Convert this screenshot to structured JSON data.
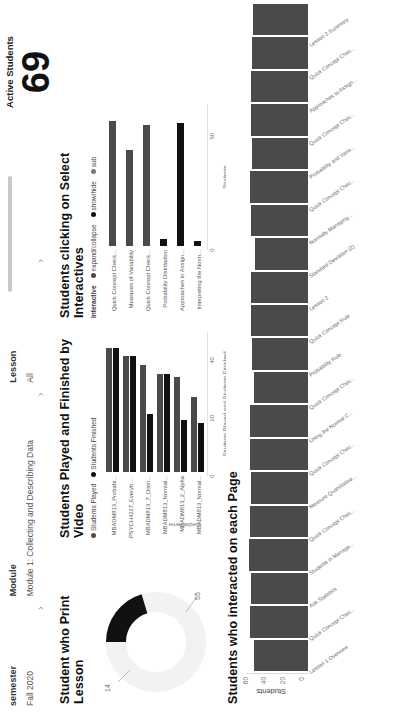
{
  "filters": {
    "items": [
      {
        "label": "semester",
        "value": "Fall 2020",
        "chevron": "chevron-right"
      },
      {
        "label": "Module",
        "value": "Module 1: Collecting and Describing Data",
        "chevron": "chevron-right"
      },
      {
        "label": "Lesson",
        "value": "All",
        "chevron": "chevron-right"
      }
    ]
  },
  "kpi": {
    "label": "Active Students",
    "value": "69"
  },
  "print_card": {
    "title": "Student who Print Lesson",
    "chart_data": {
      "type": "pie",
      "title": "Student who Print Lesson",
      "labels": [
        "Printed",
        "Not printed"
      ],
      "values": [
        14,
        55
      ],
      "value_labels": [
        "14",
        "55"
      ],
      "colors": [
        "#111111",
        "#f2f2f2"
      ],
      "legend": "none"
    }
  },
  "video_card": {
    "title": "Students Played and Finished by Video",
    "legend": [
      {
        "label": "Students Played",
        "color": "#4a4a4a"
      },
      {
        "label": "Students Finished",
        "color": "#111111"
      }
    ],
    "chart_data": {
      "type": "bar",
      "orientation": "horizontal",
      "title": "Students Played and Finished by Video",
      "xlabel": "Students Played and Students Finished",
      "ylabel": "mediaName",
      "xlim": [
        0,
        45
      ],
      "xticks": [
        0,
        20,
        40
      ],
      "xtick_labels": [
        "0",
        "20",
        "40"
      ],
      "grid": false,
      "categories": [
        "MBADM813_Probabi...",
        "PSYCH4227_Everybo...",
        "MBADM813_7_Distri...",
        "MBADM813_Normal...",
        "MBADM813_2_Alpha",
        "MBADM813_Normal..."
      ],
      "series": [
        {
          "name": "Students Played",
          "color": "#4a4a4a",
          "values": [
            43,
            40,
            37,
            34,
            33,
            26
          ]
        },
        {
          "name": "Students Finished",
          "color": "#111111",
          "values": [
            43,
            40,
            20,
            34,
            18,
            17
          ]
        }
      ]
    }
  },
  "interactives_card": {
    "title": "Students clicking on Select Interactives",
    "legend_caption": "Interactive",
    "legend": [
      {
        "label": "expand/collapse",
        "color": "#4a4a4a"
      },
      {
        "label": "show/hide",
        "color": "#111111"
      },
      {
        "label": "sub",
        "color": "#777777"
      }
    ],
    "chart_data": {
      "type": "bar",
      "orientation": "horizontal",
      "title": "Students clicking on Select Interactives",
      "xlabel": "Students",
      "xlim": [
        0,
        58
      ],
      "xticks": [
        0,
        50
      ],
      "xtick_labels": [
        "0",
        "50"
      ],
      "grid": false,
      "categories": [
        "Quick Concept Check...",
        "Measures of Variability",
        "Quick Concept Check...",
        "Probability Distribution",
        "Approaches to Assign...",
        "Interpreting the Norm..."
      ],
      "values": [
        55,
        42,
        53,
        3,
        54,
        2
      ],
      "colors": [
        "#4a4a4a",
        "#4a4a4a",
        "#4a4a4a",
        "#111111",
        "#111111",
        "#111111"
      ]
    }
  },
  "pages_card": {
    "title": "Students who interacted on each Page",
    "chart_data": {
      "type": "bar",
      "orientation": "vertical",
      "title": "Students who interacted on each Page",
      "ylabel": "Students",
      "xlabel": "",
      "ylim": [
        0,
        66
      ],
      "yticks": [
        0,
        20,
        40,
        60
      ],
      "ytick_labels": [
        "0",
        "20",
        "40",
        "60"
      ],
      "grid": false,
      "categories": [
        "Lesson 1 Overview",
        "Quick Concept Chec...",
        "Ask Statistics",
        "Students in Manage...",
        "Quick Concept Chec...",
        "Measure Quantitative...",
        "Quick Concept Chec...",
        "Using the Normal C...",
        "Quick Concept Chec...",
        "Probability Rule",
        "Quick Concept Rule",
        "Lesson 2",
        "Standard Deviation (2)",
        "Normally Managing...",
        "Quick Concept Chec...",
        "Probability and Varia...",
        "Quick Concept Chec...",
        "Approaches to Assign...",
        "Quick Concept Chec...",
        "Lesson 2 Summary"
      ],
      "values": [
        58,
        62,
        61,
        63,
        62,
        61,
        62,
        62,
        57,
        60,
        61,
        61,
        56,
        61,
        62,
        60,
        61,
        61,
        60,
        59
      ]
    }
  }
}
